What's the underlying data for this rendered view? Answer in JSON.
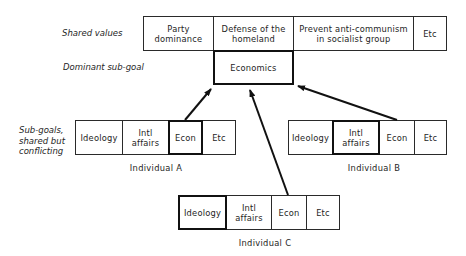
{
  "labels": {
    "shared_values": "Shared values",
    "dominant_sub_goal": "Dominant sub-goal",
    "sub_goals_line1": "Sub-goals,",
    "sub_goals_line2": "shared but",
    "sub_goals_line3": "conflicting"
  },
  "shared_values": [
    {
      "line1": "Party",
      "line2": "dominance"
    },
    {
      "line1": "Defense of the",
      "line2": "homeland"
    },
    {
      "line1": "Prevent anti-communism",
      "line2": "in socialist group"
    },
    {
      "line1": "Etc",
      "line2": ""
    }
  ],
  "dominant_sub_goal": "Economics",
  "individuals": [
    {
      "name": "Individual A",
      "highlighted": "Econ",
      "cells": [
        {
          "line1": "Ideology",
          "line2": ""
        },
        {
          "line1": "Intl",
          "line2": "affairs"
        },
        {
          "line1": "Econ",
          "line2": ""
        },
        {
          "line1": "Etc",
          "line2": ""
        }
      ]
    },
    {
      "name": "Individual B",
      "highlighted": "Intl affairs",
      "cells": [
        {
          "line1": "Ideology",
          "line2": ""
        },
        {
          "line1": "Intl",
          "line2": "affairs"
        },
        {
          "line1": "Econ",
          "line2": ""
        },
        {
          "line1": "Etc",
          "line2": ""
        }
      ]
    },
    {
      "name": "Individual C",
      "highlighted": "Ideology",
      "cells": [
        {
          "line1": "Ideology",
          "line2": ""
        },
        {
          "line1": "Intl",
          "line2": "affairs"
        },
        {
          "line1": "Econ",
          "line2": ""
        },
        {
          "line1": "Etc",
          "line2": ""
        }
      ]
    }
  ],
  "arrows": [
    {
      "from": "Individual A",
      "to": "Economics"
    },
    {
      "from": "Individual B",
      "to": "Economics"
    },
    {
      "from": "Individual C",
      "to": "Economics"
    }
  ]
}
